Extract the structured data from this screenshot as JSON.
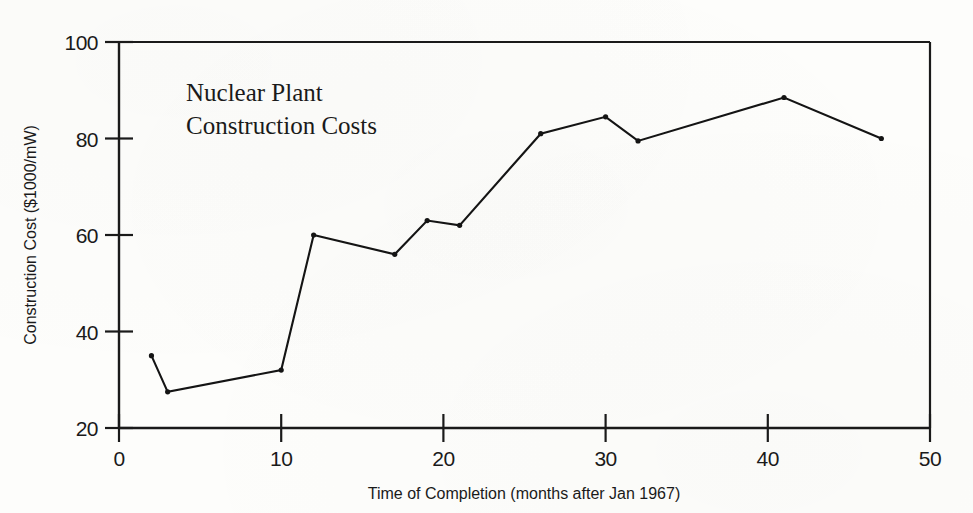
{
  "chart_data": {
    "type": "line",
    "title": "Nuclear Plant Construction Costs",
    "title_line1": "Nuclear Plant",
    "title_line2": "Construction Costs",
    "xlabel": "Time of Completion (months after Jan 1967)",
    "ylabel": "Construction Cost ($1000/mW)",
    "xlim": [
      0,
      50
    ],
    "ylim": [
      20,
      100
    ],
    "xticks": [
      0,
      10,
      20,
      30,
      40,
      50
    ],
    "yticks": [
      20,
      40,
      60,
      80,
      100
    ],
    "xtick_labels": [
      "0",
      "10",
      "20",
      "30",
      "40",
      "50"
    ],
    "ytick_labels": [
      "20",
      "40",
      "60",
      "80",
      "100"
    ],
    "grid": false,
    "legend": false,
    "marker": "dot",
    "line_color": "#141414",
    "x": [
      2,
      3,
      10,
      12,
      17,
      19,
      21,
      26,
      30,
      32,
      41,
      47
    ],
    "values": [
      35,
      27.5,
      32,
      60,
      56,
      63,
      62,
      81,
      84.5,
      79.5,
      88.5,
      80
    ],
    "points": [
      {
        "x": 2,
        "y": 35
      },
      {
        "x": 3,
        "y": 27.5
      },
      {
        "x": 10,
        "y": 32
      },
      {
        "x": 12,
        "y": 60
      },
      {
        "x": 17,
        "y": 56
      },
      {
        "x": 19,
        "y": 63
      },
      {
        "x": 21,
        "y": 62
      },
      {
        "x": 26,
        "y": 81
      },
      {
        "x": 30,
        "y": 84.5
      },
      {
        "x": 32,
        "y": 79.5
      },
      {
        "x": 41,
        "y": 88.5
      },
      {
        "x": 47,
        "y": 80
      }
    ]
  }
}
